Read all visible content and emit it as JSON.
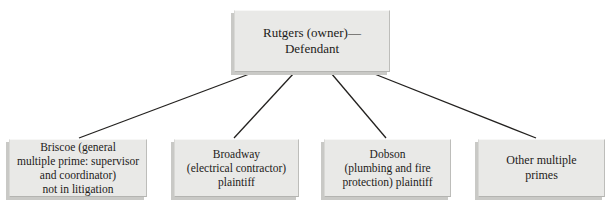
{
  "diagram": {
    "background_color": "#ffffff",
    "box_fill_color": "#e9e9e7",
    "box_shadow_color": "#c9c9c6",
    "connector_color": "#23211f",
    "text_color": "#1d1b19",
    "root": {
      "name": "rutgers-owner-defendant",
      "lines": [
        "Rutgers (owner)—",
        "Defendant"
      ]
    },
    "children": [
      {
        "name": "briscoe",
        "lines": [
          "Briscoe (general",
          "multiple prime: supervisor",
          "and coordinator)",
          "not in litigation"
        ]
      },
      {
        "name": "broadway",
        "lines": [
          "Broadway",
          "(electrical contractor)",
          "plaintiff"
        ]
      },
      {
        "name": "dobson",
        "lines": [
          "Dobson",
          "(plumbing and fire",
          "protection) plaintiff"
        ]
      },
      {
        "name": "other-multiple-primes",
        "lines": [
          "Other multiple",
          "primes"
        ]
      }
    ],
    "connectors": [
      {
        "name": "connector-root-to-briscoe",
        "x1": 252,
        "y1": 73,
        "x2": 79,
        "y2": 138
      },
      {
        "name": "connector-root-to-broadway",
        "x1": 294,
        "y1": 73,
        "x2": 234,
        "y2": 138
      },
      {
        "name": "connector-root-to-dobson",
        "x1": 331,
        "y1": 73,
        "x2": 386,
        "y2": 138
      },
      {
        "name": "connector-root-to-other",
        "x1": 372,
        "y1": 73,
        "x2": 536,
        "y2": 138
      }
    ]
  }
}
